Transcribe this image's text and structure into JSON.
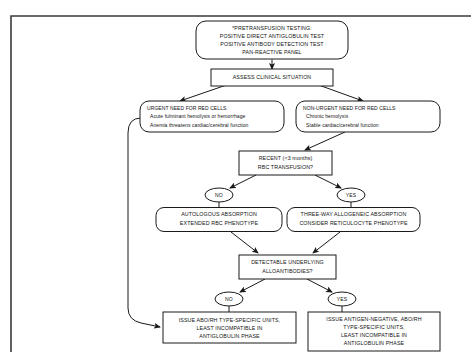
{
  "figure": {
    "kind": "clinical-decision-flowchart",
    "background_color": "#ffffff",
    "line_color": "#1a1a1a",
    "text_color": "#121212"
  },
  "nodes": {
    "pretransfusion_testing": {
      "shape": "rounded-rect",
      "lines": [
        "*PRETRANSFUSION TESTING:",
        "POSITIVE DIRECT ANTIGLOBULIN TEST",
        "POSITIVE ANTIBODY DETECTION TEST",
        "PAN-REACTIVE PANEL"
      ]
    },
    "assess_clinical_situation": {
      "shape": "rect",
      "lines": [
        "ASSESS CLINICAL SITUATION"
      ]
    },
    "urgent_need": {
      "shape": "rounded-rect",
      "lines": [
        "URGENT NEED FOR RED CELLS",
        "Acute fulminant hemolysis or hemorrhage",
        "Anemia threatens cardiac/cerebral function"
      ]
    },
    "non_urgent_need": {
      "shape": "rounded-rect",
      "lines": [
        "NON-URGENT NEED FOR RED CELLS",
        "Chronic hemolysis",
        "Stable cardiac/cerebral function"
      ]
    },
    "recent_transfusion": {
      "shape": "rect",
      "lines": [
        "RECENT (<3 months)",
        "RBC TRANSFUSION?"
      ]
    },
    "autologous_absorption": {
      "shape": "rounded-rect",
      "lines": [
        "AUTOLOGOUS ABSORPTION",
        "EXTENDED RBC PHENOTYPE"
      ]
    },
    "allogeneic_absorption": {
      "shape": "rounded-rect",
      "lines": [
        "THREE-WAY ALLOGENEIC ABSORPTION",
        "CONSIDER RETICULOCYTE PHENOTYPE"
      ]
    },
    "detectable_alloantibodies": {
      "shape": "rect",
      "lines": [
        "DETECTABLE UNDERLYING",
        "ALLOANTIBODIES?"
      ]
    },
    "issue_type_specific": {
      "shape": "rect",
      "lines": [
        "ISSUE ABO/RH TYPE-SPECIFIC UNITS,",
        "LEAST INCOMPATIBLE IN",
        "ANTIGLOBULIN PHASE"
      ]
    },
    "issue_antigen_negative": {
      "shape": "rect",
      "lines": [
        "ISSUE ANTIGEN-NEGATIVE, ABO/RH",
        "TYPE-SPECIFIC UNITS,",
        "LEAST INCOMPATIBLE IN",
        "ANTIGLOBULIN PHASE"
      ]
    }
  },
  "decision_labels": {
    "recent_no": "NO",
    "recent_yes": "YES",
    "alloantibodies_no": "NO",
    "alloantibodies_yes": "YES"
  }
}
